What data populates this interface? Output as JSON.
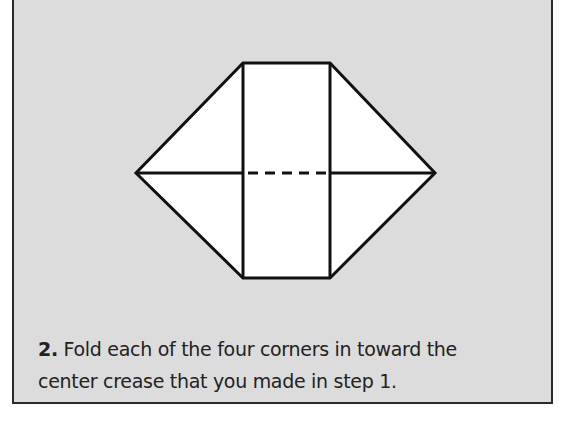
{
  "step": {
    "number": "2.",
    "line1": "Fold each of the four corners in toward the",
    "line2": "center crease that you made in step 1."
  },
  "colors": {
    "panel_background": "#dcdcdc",
    "border": "#2a2a2a",
    "paper": "#ffffff",
    "line": "#111111"
  },
  "diagram": {
    "shape": "hexagon-fold",
    "vertices": [
      [
        243,
        63
      ],
      [
        330,
        63
      ],
      [
        435,
        173
      ],
      [
        330,
        278
      ],
      [
        243,
        278
      ],
      [
        136,
        173
      ]
    ],
    "center_crease": "dashed"
  }
}
